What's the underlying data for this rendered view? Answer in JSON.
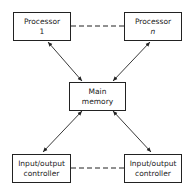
{
  "diagram": {
    "nodes": [
      {
        "id": "processor-1",
        "line1": "Processor",
        "line2": "1"
      },
      {
        "id": "processor-n",
        "line1": "Processor",
        "line2": "n"
      },
      {
        "id": "main-memory",
        "line1": "Main",
        "line2": "memory"
      },
      {
        "id": "io-controller-left",
        "line1": "Input/output",
        "line2": "controller"
      },
      {
        "id": "io-controller-right",
        "line1": "Input/output",
        "line2": "controller"
      }
    ],
    "edges": [
      {
        "from": "processor-1",
        "to": "main-memory",
        "style": "solid",
        "arrows": "both"
      },
      {
        "from": "processor-n",
        "to": "main-memory",
        "style": "solid",
        "arrows": "both"
      },
      {
        "from": "main-memory",
        "to": "io-controller-left",
        "style": "solid",
        "arrows": "both"
      },
      {
        "from": "main-memory",
        "to": "io-controller-right",
        "style": "solid",
        "arrows": "both"
      },
      {
        "from": "processor-1",
        "to": "processor-n",
        "style": "dashed",
        "arrows": "none"
      },
      {
        "from": "io-controller-left",
        "to": "io-controller-right",
        "style": "dashed",
        "arrows": "none"
      }
    ]
  }
}
